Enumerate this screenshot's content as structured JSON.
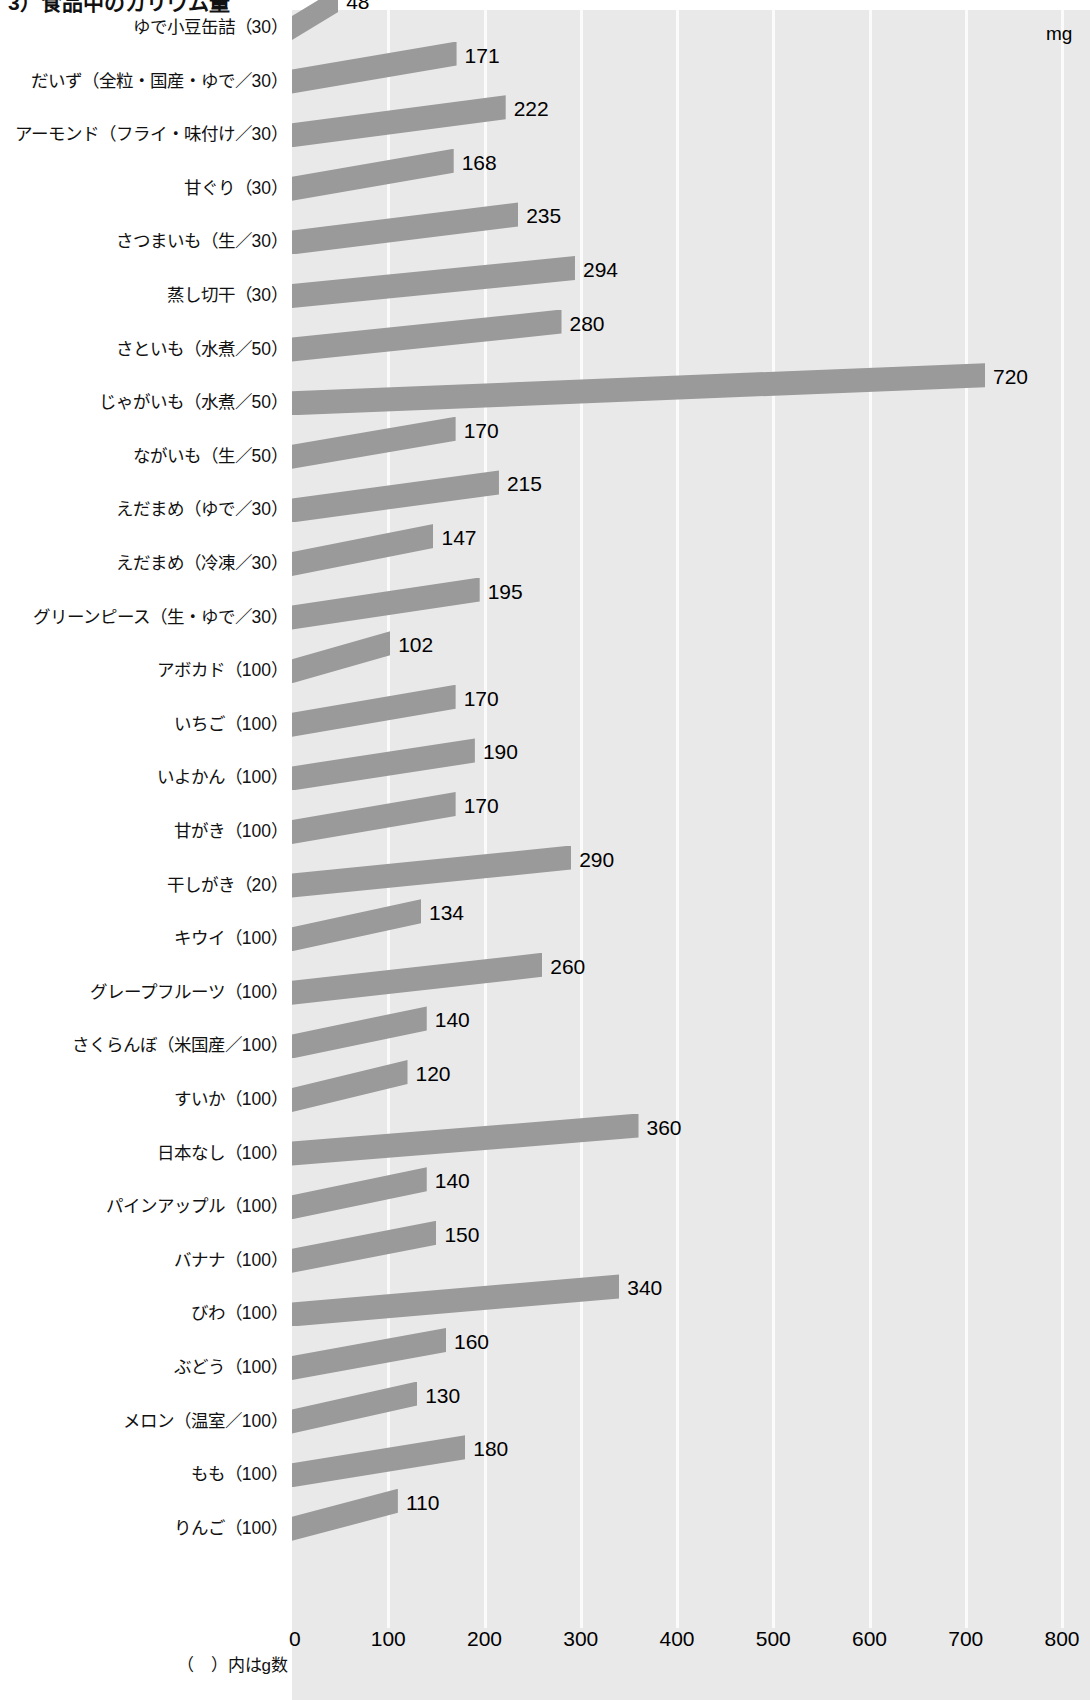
{
  "chart_data": {
    "type": "bar",
    "title": "3）食品中のカリウム量",
    "orientation": "horizontal",
    "xlabel": "mg",
    "ylabel": "",
    "xlim": [
      0,
      800
    ],
    "xticks": [
      0,
      100,
      200,
      300,
      400,
      500,
      600,
      700,
      800
    ],
    "xtick_labels": [
      "0",
      "100",
      "200",
      "300",
      "400",
      "500",
      "600",
      "700",
      "800"
    ],
    "unit": "mg",
    "note": "（　）内はg数",
    "grid": "vertical-white",
    "legend": "none",
    "bar_color": "#9a9a9a",
    "plot_background": "#e9e9e9",
    "categories": [
      "ゆで小豆缶詰（30）",
      "だいず（全粒・国産・ゆで／30）",
      "アーモンド（フライ・味付け／30）",
      "甘ぐり（30）",
      "さつまいも（生／30）",
      "蒸し切干（30）",
      "さといも（水煮／50）",
      "じゃがいも（水煮／50）",
      "ながいも（生／50）",
      "えだまめ（ゆで／30）",
      "えだまめ（冷凍／30）",
      "グリーンピース（生・ゆで／30）",
      "アボカド（100）",
      "いちご（100）",
      "いよかん（100）",
      "甘がき（100）",
      "干しがき（20）",
      "キウイ（100）",
      "グレープフルーツ（100）",
      "さくらんぼ（米国産／100）",
      "すいか（100）",
      "日本なし（100）",
      "パインアップル（100）",
      "バナナ（100）",
      "びわ（100）",
      "ぶどう（100）",
      "メロン（温室／100）",
      "もも（100）",
      "りんご（100）"
    ],
    "values": [
      48,
      171,
      222,
      168,
      235,
      294,
      280,
      720,
      170,
      215,
      147,
      195,
      102,
      170,
      190,
      170,
      290,
      134,
      260,
      140,
      120,
      360,
      140,
      150,
      340,
      160,
      130,
      180,
      110
    ],
    "value_labels": [
      "48",
      "171",
      "222",
      "168",
      "235",
      "294",
      "280",
      "720",
      "170",
      "215",
      "147",
      "195",
      "102",
      "170",
      "190",
      "170",
      "290",
      "134",
      "260",
      "140",
      "120",
      "360",
      "140",
      "150",
      "340",
      "160",
      "130",
      "180",
      "110"
    ]
  }
}
